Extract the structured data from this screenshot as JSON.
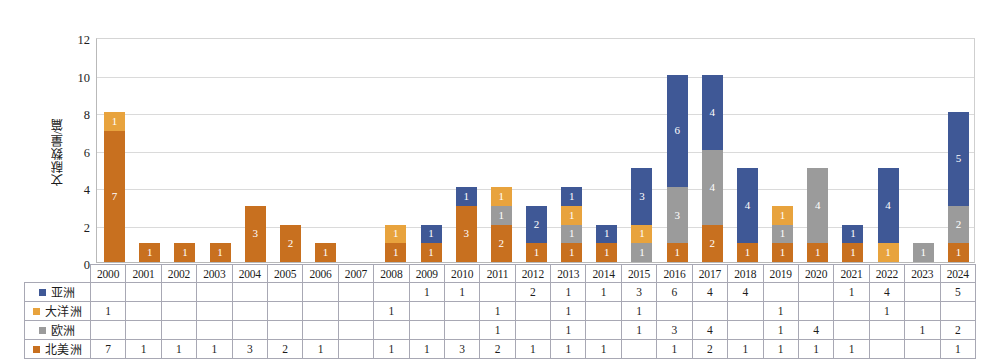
{
  "chart_data": {
    "type": "bar",
    "stacked": true,
    "title": "",
    "xlabel": "",
    "ylabel": "文献数量/篇",
    "ylim": [
      0,
      12
    ],
    "yticks": [
      0,
      2,
      4,
      6,
      8,
      10,
      12
    ],
    "grid": true,
    "legend_position": "table-left",
    "categories": [
      "2000",
      "2001",
      "2002",
      "2003",
      "2004",
      "2005",
      "2006",
      "2007",
      "2008",
      "2009",
      "2010",
      "2011",
      "2012",
      "2013",
      "2014",
      "2015",
      "2016",
      "2017",
      "2018",
      "2019",
      "2020",
      "2021",
      "2022",
      "2023",
      "2024"
    ],
    "series": [
      {
        "name": "亚洲",
        "color": "#3f5896",
        "values": [
          null,
          null,
          null,
          null,
          null,
          null,
          null,
          null,
          null,
          1,
          1,
          null,
          2,
          1,
          1,
          3,
          6,
          4,
          4,
          null,
          null,
          1,
          4,
          null,
          5
        ]
      },
      {
        "name": "大洋洲",
        "color": "#e8a33d",
        "values": [
          1,
          null,
          null,
          null,
          null,
          null,
          null,
          null,
          1,
          null,
          null,
          1,
          null,
          1,
          null,
          1,
          null,
          null,
          null,
          1,
          null,
          null,
          1,
          null,
          null
        ]
      },
      {
        "name": "欧洲",
        "color": "#9b9b9b",
        "values": [
          null,
          null,
          null,
          null,
          null,
          null,
          null,
          null,
          null,
          null,
          null,
          1,
          null,
          1,
          null,
          1,
          3,
          4,
          null,
          1,
          4,
          null,
          null,
          1,
          2
        ]
      },
      {
        "name": "北美洲",
        "color": "#c8701f",
        "values": [
          7,
          1,
          1,
          1,
          3,
          2,
          1,
          null,
          1,
          1,
          3,
          2,
          1,
          1,
          1,
          null,
          1,
          2,
          1,
          1,
          1,
          1,
          null,
          null,
          1
        ]
      }
    ],
    "totals": [
      8,
      1,
      1,
      1,
      3,
      2,
      1,
      0,
      2,
      2,
      4,
      4,
      3,
      4,
      2,
      5,
      10,
      10,
      5,
      3,
      5,
      2,
      5,
      1,
      8
    ]
  }
}
